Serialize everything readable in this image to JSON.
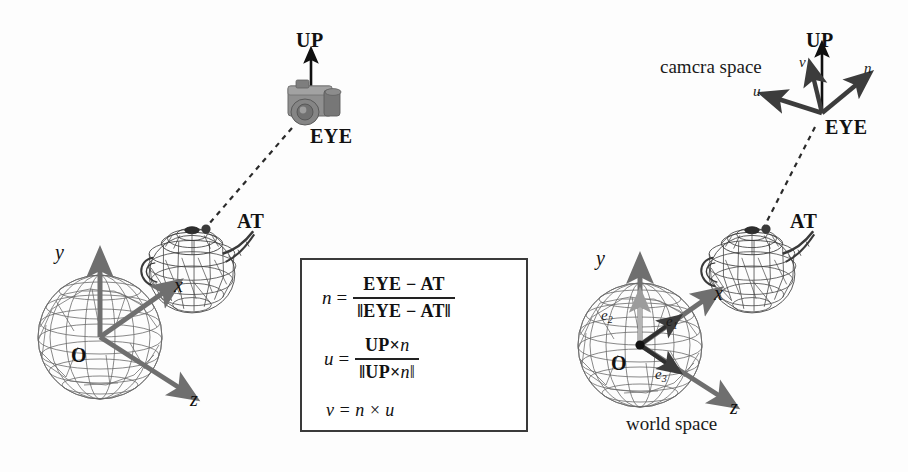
{
  "figure": {
    "caption_camera_space": "camcra space",
    "caption_world_space": "world space"
  },
  "left_diagram": {
    "up_label": "UP",
    "eye_label": "EYE",
    "at_label": "AT",
    "origin_label": "O",
    "axis_x": "x",
    "axis_y": "y",
    "axis_z": "z"
  },
  "right_diagram": {
    "up_label": "UP",
    "eye_label": "EYE",
    "at_label": "AT",
    "origin_label": "O",
    "axis_x": "x",
    "axis_y": "y",
    "axis_z": "z",
    "vec_u": "u",
    "vec_v": "v",
    "vec_n": "n",
    "basis_e1": "e",
    "basis_e1_sub": "1",
    "basis_e2": "e",
    "basis_e2_sub": "2",
    "basis_e3": "e",
    "basis_e3_sub": "3"
  },
  "formulas": {
    "eq1_lhs": "n",
    "eq1_eq": "=",
    "eq1_num": "EYE − AT",
    "eq1_den": "‖EYE − AT‖",
    "eq2_lhs": "u",
    "eq2_eq": "=",
    "eq2_num_a": "UP",
    "eq2_num_times": "×",
    "eq2_num_b": "n",
    "eq2_den_a": "‖UP",
    "eq2_den_times": "×",
    "eq2_den_b": "n‖",
    "eq3": "v = n × u"
  },
  "colors": {
    "axis_gray": "#6f6f6f",
    "vector_dark": "#3c3c3c",
    "wire_gray": "#555555",
    "ink": "#111111",
    "camera_body": "#8a8a8a",
    "box_border": "#3a3a3a"
  }
}
